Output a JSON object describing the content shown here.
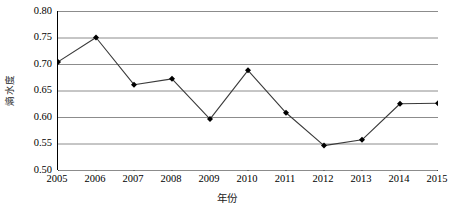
{
  "chart_data": {
    "type": "line",
    "title": "",
    "xlabel": "年份",
    "ylabel": "熵水度",
    "x": [
      2005,
      2006,
      2007,
      2008,
      2009,
      2010,
      2011,
      2012,
      2013,
      2014,
      2015
    ],
    "categories": [
      "2005",
      "2006",
      "2007",
      "2008",
      "2009",
      "2010",
      "2011",
      "2012",
      "2013",
      "2014",
      "2015"
    ],
    "values": [
      0.704,
      0.75,
      0.661,
      0.672,
      0.596,
      0.688,
      0.608,
      0.546,
      0.557,
      0.625,
      0.626
    ],
    "series": [
      {
        "name": "熵水度",
        "values": [
          0.704,
          0.75,
          0.661,
          0.672,
          0.596,
          0.688,
          0.608,
          0.546,
          0.557,
          0.625,
          0.626
        ]
      }
    ],
    "ylim": [
      0.5,
      0.8
    ],
    "xlim": [
      2005,
      2015
    ],
    "ytick_labels": [
      "0.80",
      "0.75",
      "0.70",
      "0.65",
      "0.60",
      "0.55",
      "0.50"
    ],
    "ytick_values": [
      0.8,
      0.75,
      0.7,
      0.65,
      0.6,
      0.55,
      0.5
    ],
    "ytick_step": 0.05,
    "grid": true,
    "grid_axis": "y",
    "legend": false,
    "legend_position": "none",
    "marker": "diamond",
    "marker_color": "#000000",
    "line_color": "#3a3a3a",
    "grid_color": "#8c8c8c",
    "axis_color": "#000000",
    "background": "#ffffff"
  }
}
